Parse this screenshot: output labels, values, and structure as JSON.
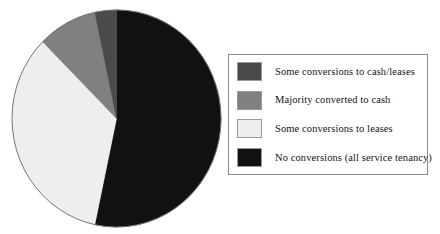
{
  "chart_data": {
    "type": "pie",
    "title": "",
    "subtitle": "",
    "xlabel": "",
    "ylabel": "",
    "grid": false,
    "legend_position": "right",
    "start_angle_deg": 0,
    "direction": "clockwise",
    "categories": [
      "Some conversions to cash/leases",
      "Majority converted to cash",
      "Some conversions to leases",
      "No conversions (all service tenancy)"
    ],
    "values": [
      4,
      9,
      34,
      53
    ],
    "units": "percent",
    "slices": [
      {
        "label": "Some conversions to cash/leases",
        "value": 4,
        "color": "#4a4a4a",
        "start_deg": 348,
        "end_deg": 360
      },
      {
        "label": "Majority converted to cash",
        "value": 9,
        "color": "#808080",
        "start_deg": 315,
        "end_deg": 348
      },
      {
        "label": "Some conversions to leases",
        "value": 34,
        "color": "#eeeeec",
        "start_deg": 192,
        "end_deg": 315
      },
      {
        "label": "No conversions (all service tenancy)",
        "value": 53,
        "color": "#111111",
        "start_deg": 0,
        "end_deg": 192
      }
    ]
  },
  "legend": {
    "items": [
      {
        "label": "Some conversions to cash/leases",
        "color": "#4a4a4a"
      },
      {
        "label": "Majority converted to cash",
        "color": "#808080"
      },
      {
        "label": "Some conversions to leases",
        "color": "#eeeeec"
      },
      {
        "label": "No conversions (all service tenancy)",
        "color": "#111111"
      }
    ]
  },
  "colors": {
    "slice_dark_gray": "#4a4a4a",
    "slice_medium_gray": "#808080",
    "slice_light_gray": "#eeeeec",
    "slice_black": "#111111",
    "pie_outline": "#777777",
    "legend_border": "#8a8a8a",
    "background": "#ffffff",
    "text": "#141414"
  }
}
